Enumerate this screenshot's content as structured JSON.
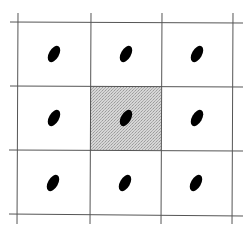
{
  "diagram": {
    "type": "grid",
    "rows": 3,
    "cols": 3,
    "line_color": "#555555",
    "dot_color": "#000000",
    "highlight_color": "#c8c8c8",
    "highlighted_cell": {
      "row": 1,
      "col": 1
    },
    "cells": [
      {
        "row": 0,
        "col": 0,
        "has_dot": true,
        "shaded": false
      },
      {
        "row": 0,
        "col": 1,
        "has_dot": true,
        "shaded": false
      },
      {
        "row": 0,
        "col": 2,
        "has_dot": true,
        "shaded": false
      },
      {
        "row": 1,
        "col": 0,
        "has_dot": true,
        "shaded": false
      },
      {
        "row": 1,
        "col": 1,
        "has_dot": true,
        "shaded": true
      },
      {
        "row": 1,
        "col": 2,
        "has_dot": true,
        "shaded": false
      },
      {
        "row": 2,
        "col": 0,
        "has_dot": true,
        "shaded": false
      },
      {
        "row": 2,
        "col": 1,
        "has_dot": true,
        "shaded": false
      },
      {
        "row": 2,
        "col": 2,
        "has_dot": true,
        "shaded": false
      }
    ]
  }
}
